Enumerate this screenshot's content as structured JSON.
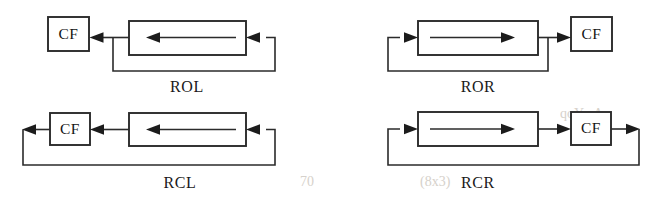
{
  "figure": {
    "name": "register-rotate-shift-operations",
    "background_color": "#ffffff",
    "line_color": "#2b2b2b",
    "text_color": "#1a1a1a",
    "panel_count": 4
  },
  "panels": [
    {
      "id": "rol",
      "label": "ROL",
      "cf_label": "CF",
      "cf_position": "left",
      "direction": "left",
      "operation": "rotate-left",
      "has_closing_loop": false,
      "loop_description": "output of register feeds CF and wraps around to register right input"
    },
    {
      "id": "ror",
      "label": "ROR",
      "cf_label": "CF",
      "cf_position": "right",
      "direction": "right",
      "operation": "rotate-right",
      "has_closing_loop": false,
      "loop_description": "output of register feeds CF and wraps around to register left input"
    },
    {
      "id": "rcl",
      "label": "RCL",
      "cf_label": "CF",
      "cf_position": "left",
      "direction": "left",
      "operation": "rotate-through-carry-left",
      "has_closing_loop": true,
      "loop_description": "register output through CF, then CF output wraps around to register right input"
    },
    {
      "id": "rcr",
      "label": "RCR",
      "cf_label": "CF",
      "cf_position": "right",
      "direction": "right",
      "operation": "rotate-through-carry-right",
      "has_closing_loop": true,
      "loop_description": "register output through CF, then CF output wraps around to register left input"
    }
  ]
}
